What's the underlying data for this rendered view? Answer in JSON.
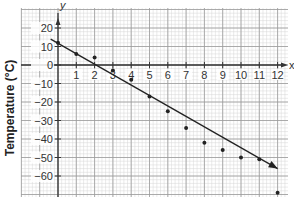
{
  "chart_data": {
    "type": "scatter",
    "title": "",
    "xlabel": "x",
    "ylabel": "Temperature (°C)",
    "y_axis_letter": "y",
    "x_axis_letter": "x",
    "xlim": [
      -2,
      12.6
    ],
    "ylim": [
      -71,
      29
    ],
    "grid": true,
    "x_ticks": [
      1,
      2,
      3,
      4,
      5,
      6,
      7,
      8,
      9,
      10,
      11,
      12
    ],
    "y_ticks": [
      20,
      10,
      0,
      -10,
      -20,
      -30,
      -40,
      -50,
      -60
    ],
    "x_tick_labels": [
      "1",
      "2",
      "3",
      "4",
      "5",
      "6",
      "7",
      "8",
      "9",
      "10",
      "11",
      "12"
    ],
    "y_tick_labels": [
      "20",
      "10",
      "0",
      "−10",
      "−20",
      "−30",
      "−40",
      "−50",
      "−60"
    ],
    "series": [
      {
        "name": "data points",
        "x": [
          0,
          1,
          2,
          3,
          4,
          5,
          6,
          7,
          8,
          9,
          10,
          11,
          12
        ],
        "y": [
          12,
          6,
          4,
          -3,
          -8,
          -17,
          -25,
          -34,
          -42,
          -46,
          -50,
          -51,
          -69
        ]
      }
    ],
    "trend_line": {
      "name": "line of best fit",
      "start": [
        -0.4,
        14
      ],
      "end": [
        12,
        -56
      ],
      "arrow": true
    },
    "colors": {
      "point": "#222222",
      "line": "#222222",
      "grid_major": "#9a9a9a",
      "grid_minor": "#d6d6d6"
    }
  }
}
